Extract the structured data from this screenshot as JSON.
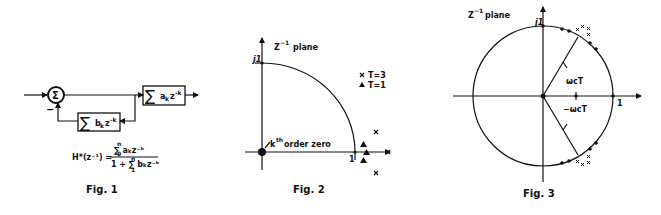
{
  "figures": [
    {
      "id": "fig1",
      "caption": "Fig. 1",
      "summing_junction": "Σ",
      "feedback_sign": "−",
      "forward_block": {
        "sigma": "∑",
        "term": "a",
        "sub": "k",
        "z": "z",
        "exp": "-k"
      },
      "feedback_block": {
        "sigma": "∑",
        "term": "b",
        "sub": "k",
        "z": "z",
        "exp": "-k"
      },
      "formula": {
        "lhs": "H*(z⁻¹) =",
        "numerator": "∑ aₖz⁻ᵏ",
        "num_upper": "n",
        "num_lower": "0",
        "denominator": "1 + ∑ bₖz⁻ᵏ",
        "den_upper": "n",
        "den_lower": "1"
      }
    },
    {
      "id": "fig2",
      "caption": "Fig. 2",
      "plane_label": "Z",
      "plane_exp": "−1",
      "plane_word": "plane",
      "j1_label": "j1",
      "one_label": "1",
      "zero_annotation": "kth order zero",
      "zero_k": "k",
      "zero_th": "th",
      "zero_rest": "order zero",
      "legend": [
        {
          "marker": "x",
          "label": "T=3"
        },
        {
          "marker": "▲",
          "label": "T=1"
        }
      ]
    },
    {
      "id": "fig3",
      "caption": "Fig. 3",
      "plane_label": "Z",
      "plane_exp": "−1",
      "plane_word": "plane",
      "j1_label": "j1",
      "one_label": "1",
      "upper_angle": "ωcT",
      "lower_angle": "−ωcT",
      "pole_marker": "x",
      "zero_marker": "●"
    }
  ]
}
